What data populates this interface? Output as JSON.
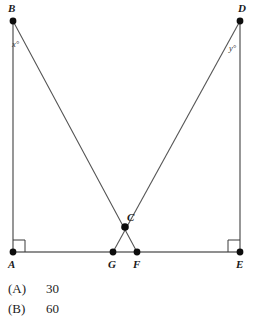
{
  "figure": {
    "type": "geometry-diagram",
    "background_color": "#ffffff",
    "line_color": "#6a6a6a",
    "dot_color": "#0d0d0d",
    "points": [
      {
        "id": "B",
        "label": "B",
        "x": 13,
        "y": 21,
        "label_x": 8,
        "label_y": 12
      },
      {
        "id": "D",
        "label": "D",
        "x": 240,
        "y": 21,
        "label_x": 238,
        "label_y": 12
      },
      {
        "id": "A",
        "label": "A",
        "x": 13,
        "y": 252,
        "label_x": 8,
        "label_y": 268
      },
      {
        "id": "G",
        "label": "G",
        "x": 113,
        "y": 252,
        "label_x": 108,
        "label_y": 268
      },
      {
        "id": "F",
        "label": "F",
        "x": 137,
        "y": 252,
        "label_x": 133,
        "label_y": 268
      },
      {
        "id": "E",
        "label": "E",
        "x": 240,
        "y": 252,
        "label_x": 236,
        "label_y": 268
      },
      {
        "id": "C",
        "label": "C",
        "x": 125,
        "y": 227,
        "label_x": 127,
        "label_y": 221
      }
    ],
    "segments": [
      {
        "name": "segment-AB",
        "from": "A",
        "to": "B",
        "style": "vertical"
      },
      {
        "name": "segment-DE",
        "from": "D",
        "to": "E",
        "style": "vertical"
      },
      {
        "name": "segment-AE-baseline",
        "from": "A",
        "to": "E",
        "style": "baseline"
      },
      {
        "name": "segment-BF",
        "from": "B",
        "to": "F",
        "style": "cevian"
      },
      {
        "name": "segment-DG",
        "from": "D",
        "to": "G",
        "style": "cevian"
      }
    ],
    "angles": [
      {
        "name": "angle-x",
        "label": "x°",
        "at": "B",
        "label_x": 12,
        "label_y": 47
      },
      {
        "name": "angle-y",
        "label": "y°",
        "at": "D",
        "label_x": 229,
        "label_y": 51
      }
    ],
    "right_angles": [
      {
        "name": "right-angle-A",
        "at": "A",
        "opens": "up-right"
      },
      {
        "name": "right-angle-E",
        "at": "E",
        "opens": "up-left"
      }
    ]
  },
  "answers": {
    "options": [
      {
        "key": "(A)",
        "value": "30"
      },
      {
        "key": "(B)",
        "value": "60"
      }
    ]
  }
}
